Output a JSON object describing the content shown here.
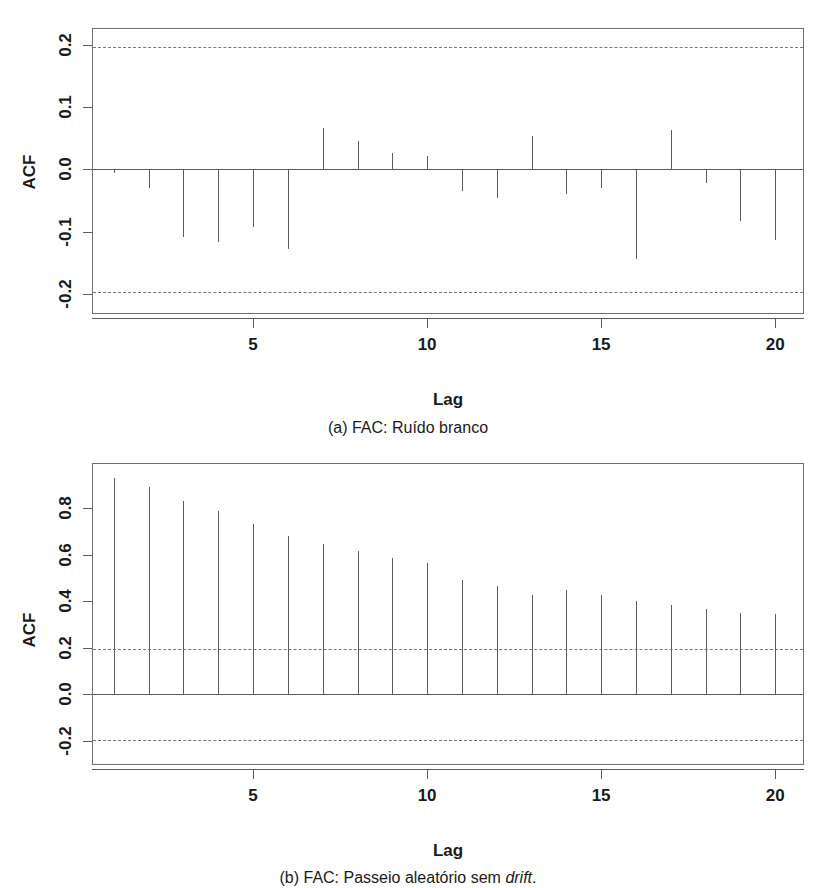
{
  "figure": {
    "panels": [
      {
        "id": "panel-a",
        "caption": "(a) FAC: Ruído branco",
        "caption_italic_word": "",
        "chart_data": {
          "type": "bar",
          "title": "",
          "subtitle": "",
          "xlabel": "Lag",
          "ylabel": "ACF",
          "grid": false,
          "legend": "none",
          "xlim": [
            0.4,
            20.8
          ],
          "ylim": [
            -0.23,
            0.225
          ],
          "xticks": [
            5,
            10,
            15,
            20
          ],
          "xtick_labels": [
            "5",
            "10",
            "15",
            "20"
          ],
          "yticks": [
            0.2,
            0.1,
            0.0,
            -0.1,
            -0.2
          ],
          "ytick_labels": [
            "0.2",
            "0.1",
            "0.0",
            "-0.1",
            "-0.2"
          ],
          "annotations": [
            "dashed confidence band at +0.196",
            "dashed confidence band at -0.196"
          ],
          "confidence_band": [
            0.196,
            -0.196
          ],
          "categories": [
            1,
            2,
            3,
            4,
            5,
            6,
            7,
            8,
            9,
            10,
            11,
            12,
            13,
            14,
            15,
            16,
            17,
            18,
            19,
            20
          ],
          "values": [
            -0.006,
            -0.03,
            -0.108,
            -0.117,
            -0.093,
            -0.128,
            0.066,
            0.046,
            0.027,
            0.022,
            -0.035,
            -0.045,
            0.053,
            -0.04,
            -0.029,
            -0.143,
            0.063,
            -0.022,
            -0.083,
            -0.113
          ]
        }
      },
      {
        "id": "panel-b",
        "caption_prefix": "(b) FAC: Passeio aleatório sem ",
        "caption_italic_word": "drift",
        "caption_suffix": ".",
        "chart_data": {
          "type": "bar",
          "title": "",
          "subtitle": "",
          "xlabel": "Lag",
          "ylabel": "ACF",
          "grid": false,
          "legend": "none",
          "xlim": [
            0.4,
            20.8
          ],
          "ylim": [
            -0.3,
            0.99
          ],
          "xticks": [
            5,
            10,
            15,
            20
          ],
          "xtick_labels": [
            "5",
            "10",
            "15",
            "20"
          ],
          "yticks": [
            0.8,
            0.6,
            0.4,
            0.2,
            0.0,
            -0.2
          ],
          "ytick_labels": [
            "0.8",
            "0.6",
            "0.4",
            "0.2",
            "0.0",
            "-0.2"
          ],
          "annotations": [
            "dashed confidence band at +0.196",
            "dashed confidence band at -0.196"
          ],
          "confidence_band": [
            0.196,
            -0.196
          ],
          "categories": [
            1,
            2,
            3,
            4,
            5,
            6,
            7,
            8,
            9,
            10,
            11,
            12,
            13,
            14,
            15,
            16,
            17,
            18,
            19,
            20
          ],
          "values": [
            0.93,
            0.89,
            0.83,
            0.79,
            0.73,
            0.68,
            0.645,
            0.615,
            0.585,
            0.565,
            0.49,
            0.465,
            0.425,
            0.45,
            0.425,
            0.4,
            0.385,
            0.365,
            0.35,
            0.345
          ]
        }
      }
    ]
  }
}
